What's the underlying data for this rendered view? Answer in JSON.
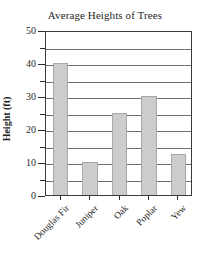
{
  "chart_data": {
    "type": "bar",
    "title": "Average Heights of Trees",
    "xlabel": "",
    "ylabel": "Height (ft)",
    "categories": [
      "Douglas Fir",
      "Juniper",
      "Oak",
      "Poplar",
      "Yew"
    ],
    "values": [
      40,
      10,
      25,
      30,
      12.5
    ],
    "ylim": [
      0,
      50
    ],
    "y_major_ticks": [
      0,
      10,
      20,
      30,
      40,
      50
    ],
    "y_minor_ticks": [
      5,
      15,
      25,
      35,
      45
    ],
    "y_tick_labels": [
      "0",
      "10",
      "20",
      "30",
      "40",
      "50"
    ],
    "gridlines": {
      "horizontal": true,
      "vertical": false,
      "interval": 5
    },
    "legend": null,
    "series": [
      {
        "name": "Average Height",
        "values": [
          40,
          10,
          25,
          30,
          12.5
        ]
      }
    ],
    "colors": {
      "bar_fill": "#cccccc",
      "bar_border": "#a8a8a8",
      "gridline": "#6e6e6e",
      "frame": "#3a3a3a",
      "text": "#1f1f1f",
      "background": "#ffffff"
    }
  }
}
